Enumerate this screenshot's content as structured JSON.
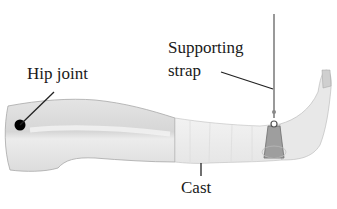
{
  "diagram": {
    "labels": {
      "hip_joint": "Hip joint",
      "supporting_strap_line1": "Supporting",
      "supporting_strap_line2": "strap",
      "cast": "Cast"
    },
    "colors": {
      "leg_fill": "#dedede",
      "leg_outline": "#9a9a9a",
      "cast_fill": "#eeeeee",
      "strap_fill": "#9a9a9a",
      "joint_dot": "#000000",
      "leader_line": "#222222",
      "background": "#ffffff"
    }
  }
}
